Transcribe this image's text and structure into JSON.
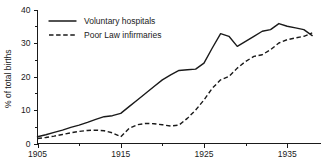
{
  "chart_data": {
    "type": "line",
    "title": "",
    "xlabel": "",
    "ylabel": "% of total births",
    "xlim": [
      1905,
      1939
    ],
    "ylim": [
      0,
      40
    ],
    "grid": false,
    "legend_position": "top-left",
    "x_ticks_major": [
      1905,
      1915,
      1925,
      1935
    ],
    "x_ticks_minor": [
      1910,
      1920,
      1930
    ],
    "x_tick_labels": [
      "1905",
      "1915",
      "1925",
      "1935"
    ],
    "y_ticks_major": [
      0,
      10,
      20,
      30,
      40
    ],
    "y_ticks_minor": [
      5,
      15,
      25,
      35
    ],
    "y_tick_labels": [
      "0",
      "10",
      "20",
      "30",
      "40"
    ],
    "series": [
      {
        "name": "Voluntary hospitals",
        "style": "solid",
        "x": [
          1905,
          1906,
          1907,
          1908,
          1909,
          1910,
          1911,
          1912,
          1913,
          1914,
          1915,
          1916,
          1917,
          1918,
          1919,
          1920,
          1921,
          1922,
          1923,
          1924,
          1925,
          1926,
          1927,
          1928,
          1929,
          1930,
          1931,
          1932,
          1933,
          1934,
          1935,
          1936,
          1937,
          1938
        ],
        "values": [
          2.0,
          2.6,
          3.3,
          4.0,
          4.8,
          5.5,
          6.3,
          7.2,
          8.0,
          8.3,
          9.0,
          11.0,
          13.0,
          15.0,
          17.0,
          19.0,
          20.5,
          21.8,
          22.0,
          22.2,
          24.0,
          28.5,
          32.8,
          32.0,
          29.0,
          30.5,
          32.0,
          33.5,
          34.0,
          35.8,
          35.0,
          34.5,
          34.0,
          32.2
        ]
      },
      {
        "name": "Poor Law infirmaries",
        "style": "dashed",
        "x": [
          1905,
          1906,
          1907,
          1908,
          1909,
          1910,
          1911,
          1912,
          1913,
          1914,
          1915,
          1916,
          1917,
          1918,
          1919,
          1920,
          1921,
          1922,
          1923,
          1924,
          1925,
          1926,
          1927,
          1928,
          1929,
          1930,
          1931,
          1932,
          1933,
          1934,
          1935,
          1936,
          1937,
          1938
        ],
        "values": [
          1.5,
          1.8,
          2.2,
          2.7,
          3.2,
          3.6,
          3.9,
          4.0,
          3.8,
          3.2,
          2.0,
          4.5,
          5.6,
          6.0,
          5.9,
          5.6,
          5.2,
          5.5,
          7.5,
          10.0,
          13.0,
          16.5,
          19.0,
          20.0,
          22.5,
          24.5,
          26.0,
          26.5,
          28.0,
          30.0,
          31.0,
          31.5,
          32.0,
          33.0
        ]
      }
    ]
  },
  "legend": {
    "items": [
      {
        "label": "Voluntary hospitals",
        "style": "solid"
      },
      {
        "label": "Poor Law infirmaries",
        "style": "dashed"
      }
    ]
  }
}
